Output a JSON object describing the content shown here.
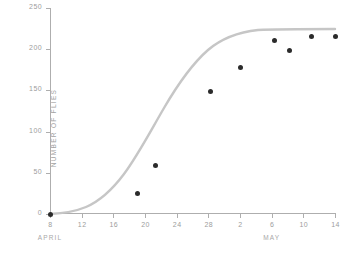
{
  "chart_data": {
    "type": "scatter",
    "title": "",
    "xlabel": "",
    "ylabel": "NUMBER OF FLIES",
    "ylim": [
      0,
      250
    ],
    "yticks": [
      0,
      50,
      100,
      150,
      200,
      250
    ],
    "ytick_labels": [
      "0",
      "50",
      "100",
      "150",
      "200",
      "250"
    ],
    "grid": false,
    "legend": "none",
    "x_axis": {
      "unit": "date",
      "xlim_days": [
        0,
        36
      ],
      "ticks": [
        {
          "label": "8",
          "day": 0
        },
        {
          "label": "12",
          "day": 4
        },
        {
          "label": "16",
          "day": 8
        },
        {
          "label": "20",
          "day": 12
        },
        {
          "label": "24",
          "day": 16
        },
        {
          "label": "28",
          "day": 20
        },
        {
          "label": "2",
          "day": 24
        },
        {
          "label": "6",
          "day": 28
        },
        {
          "label": "10",
          "day": 32
        },
        {
          "label": "14",
          "day": 36
        }
      ],
      "month_labels": [
        {
          "label": "APRIL",
          "day": 0
        },
        {
          "label": "MAY",
          "day": 28
        }
      ]
    },
    "points": [
      {
        "label": "April 8",
        "day": 0,
        "value": 0
      },
      {
        "label": "April 19",
        "day": 11.0,
        "value": 25
      },
      {
        "label": "April 21",
        "day": 13.3,
        "value": 59
      },
      {
        "label": "April 28",
        "day": 20.3,
        "value": 149
      },
      {
        "label": "May 2",
        "day": 24.1,
        "value": 178
      },
      {
        "label": "May 6",
        "day": 28.4,
        "value": 210
      },
      {
        "label": "May 8",
        "day": 30.2,
        "value": 199
      },
      {
        "label": "May 11",
        "day": 33.0,
        "value": 216
      },
      {
        "label": "May 14",
        "day": 36.0,
        "value": 216
      }
    ],
    "fit_curve": {
      "kind": "logistic",
      "description": "smooth sigmoid growth curve fitted through points",
      "path": "M 0,206 C 10,205.5 24,204 36,199 C 50,193 62,182 74,166 C 88,147 100,124 114,100 C 128,76 142,56 158,42 C 172,30 190,24 208,22 C 226,21 248,21 285,21",
      "color": "#c6c6c6",
      "width": 2.4
    },
    "colors": {
      "marker": "#2b2b2b",
      "curve": "#c6c6c6",
      "axis": "#aeaeae",
      "tick_text": "#9d9d9d",
      "background": "#ffffff"
    }
  }
}
